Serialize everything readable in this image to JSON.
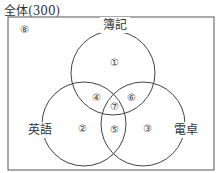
{
  "diagram": {
    "title": "全体(300)",
    "sets": {
      "top": "簿記",
      "left": "英語",
      "right": "電卓"
    },
    "regions": {
      "r1": "①",
      "r2": "②",
      "r3": "③",
      "r4": "④",
      "r5": "⑤",
      "r6": "⑥",
      "r7": "⑦",
      "r8": "⑧"
    }
  }
}
